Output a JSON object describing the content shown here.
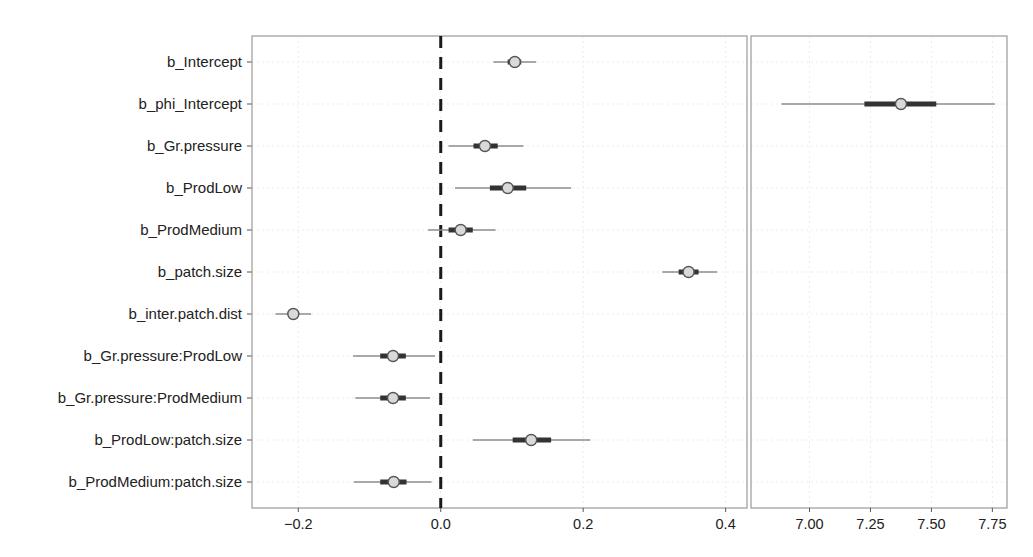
{
  "chart_data": {
    "type": "interval-plot",
    "title": "",
    "layout": {
      "panels": 2,
      "grid": true,
      "legend": "none",
      "reference_line": {
        "panel": "left",
        "x": 0.0,
        "style": "dashed",
        "color": "#1a1a1a"
      }
    },
    "parameters": [
      "b_Intercept",
      "b_phi_Intercept",
      "b_Gr.pressure",
      "b_ProdLow",
      "b_ProdMedium",
      "b_patch.size",
      "b_inter.patch.dist",
      "b_Gr.pressure:ProdLow",
      "b_Gr.pressure:ProdMedium",
      "b_ProdLow:patch.size",
      "b_ProdMedium:patch.size"
    ],
    "panels": [
      {
        "name": "left",
        "xlim": [
          -0.265,
          0.43
        ],
        "xticks": [
          -0.2,
          0.0,
          0.2,
          0.4
        ],
        "xtick_labels": [
          "−0.2",
          "0.0",
          "0.2",
          "0.4"
        ],
        "series": [
          {
            "parameter": "b_Intercept",
            "estimate": 0.104,
            "inner": [
              0.094,
              0.113
            ],
            "outer": [
              0.074,
              0.134
            ]
          },
          {
            "parameter": "b_Gr.pressure",
            "estimate": 0.062,
            "inner": [
              0.046,
              0.08
            ],
            "outer": [
              0.011,
              0.116
            ]
          },
          {
            "parameter": "b_ProdLow",
            "estimate": 0.094,
            "inner": [
              0.069,
              0.12
            ],
            "outer": [
              0.02,
              0.183
            ]
          },
          {
            "parameter": "b_ProdMedium",
            "estimate": 0.028,
            "inner": [
              0.011,
              0.045
            ],
            "outer": [
              -0.018,
              0.077
            ]
          },
          {
            "parameter": "b_patch.size",
            "estimate": 0.348,
            "inner": [
              0.334,
              0.362
            ],
            "outer": [
              0.311,
              0.388
            ]
          },
          {
            "parameter": "b_inter.patch.dist",
            "estimate": -0.207,
            "inner": [
              -0.214,
              -0.2
            ],
            "outer": [
              -0.232,
              -0.182
            ]
          },
          {
            "parameter": "b_Gr.pressure:ProdLow",
            "estimate": -0.067,
            "inner": [
              -0.085,
              -0.049
            ],
            "outer": [
              -0.123,
              -0.008
            ]
          },
          {
            "parameter": "b_Gr.pressure:ProdMedium",
            "estimate": -0.067,
            "inner": [
              -0.085,
              -0.049
            ],
            "outer": [
              -0.12,
              -0.015
            ]
          },
          {
            "parameter": "b_ProdLow:patch.size",
            "estimate": 0.127,
            "inner": [
              0.101,
              0.155
            ],
            "outer": [
              0.045,
              0.21
            ]
          },
          {
            "parameter": "b_ProdMedium:patch.size",
            "estimate": -0.066,
            "inner": [
              -0.085,
              -0.048
            ],
            "outer": [
              -0.122,
              -0.013
            ]
          }
        ]
      },
      {
        "name": "right",
        "xlim": [
          6.76,
          7.81
        ],
        "xticks": [
          7.0,
          7.25,
          7.5,
          7.75
        ],
        "xtick_labels": [
          "7.00",
          "7.25",
          "7.50",
          "7.75"
        ],
        "series": [
          {
            "parameter": "b_phi_Intercept",
            "estimate": 7.375,
            "inner": [
              7.225,
              7.52
            ],
            "outer": [
              6.885,
              7.76
            ]
          }
        ]
      }
    ],
    "colors": {
      "point_fill": "#d9d9d9",
      "point_stroke": "#555555",
      "inner_interval": "#333333",
      "outer_interval": "#8c8c8c",
      "frame": "#9a9a9a",
      "grid": "#ececec"
    },
    "xlabel": "",
    "ylabel": ""
  }
}
